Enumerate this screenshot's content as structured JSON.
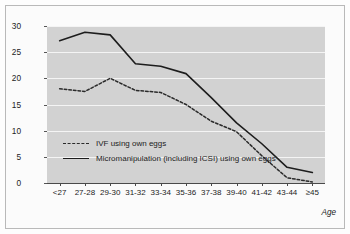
{
  "figure": {
    "y_axis_title": "Live birth per cycle started (percentage)",
    "x_axis_title": "Age"
  },
  "legend": {
    "items": [
      {
        "label": "IVF using own eggs",
        "style": "dashed",
        "color": "#2a2a2a"
      },
      {
        "label": "Micromanipulation (including ICSI) using own eggs",
        "style": "solid",
        "color": "#1d1d1d"
      }
    ]
  },
  "chart_data": {
    "type": "line",
    "title": "",
    "xlabel": "Age",
    "ylabel": "Live birth per cycle started (percentage)",
    "categories": [
      "<27",
      "27-28",
      "29-30",
      "31-32",
      "33-34",
      "35-36",
      "37-38",
      "39-40",
      "41-42",
      "43-44",
      "≥45"
    ],
    "yticks": [
      0,
      5,
      10,
      15,
      20,
      25,
      30
    ],
    "ylim": [
      0,
      30
    ],
    "grid": "horizontal",
    "legend_position": "inside-lower-left",
    "plot_background": "#d2d2d2",
    "gridline_color": "#f4f4f4",
    "series": [
      {
        "name": "IVF using own eggs",
        "style": "dashed",
        "color": "#2a2a2a",
        "values": [
          18.0,
          17.5,
          20.0,
          17.7,
          17.3,
          15.0,
          11.8,
          9.8,
          5.2,
          1.0,
          0.2
        ]
      },
      {
        "name": "Micromanipulation (including ICSI) using own eggs",
        "style": "solid",
        "color": "#1d1d1d",
        "values": [
          27.2,
          28.8,
          28.3,
          22.8,
          22.3,
          20.9,
          16.3,
          11.5,
          7.5,
          3.0,
          2.0
        ]
      }
    ]
  }
}
